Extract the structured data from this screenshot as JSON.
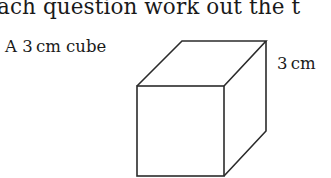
{
  "question": {
    "heading": "ach question work out the t",
    "figure": {
      "caption": "A 3 cm cube",
      "dimension_label": "3 cm",
      "shape": "cube",
      "line_color": "#2b2b2b"
    }
  }
}
